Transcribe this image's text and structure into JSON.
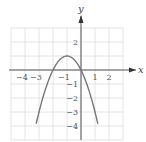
{
  "chart_data": {
    "type": "line",
    "title": "",
    "xlabel": "x",
    "ylabel": "y",
    "xlim": [
      -5,
      3
    ],
    "ylim": [
      -5,
      3
    ],
    "grid": true,
    "x_ticks": [
      "-4",
      "-3",
      "-1",
      "1",
      "2"
    ],
    "y_ticks": [
      "2",
      "-1",
      "-2",
      "-3",
      "-4"
    ],
    "series": [
      {
        "name": "parabola",
        "equation": "y = -x^2 - 2x",
        "x": [
          -3.2,
          -3,
          -2.5,
          -2,
          -1.5,
          -1,
          -0.5,
          0,
          0.5,
          1,
          1.2
        ],
        "y": [
          -3.84,
          -3,
          -1.25,
          0,
          0.75,
          1,
          0.75,
          0,
          -1.25,
          -3,
          -3.84
        ],
        "color": "#777777"
      }
    ],
    "vertex": [
      -1,
      1
    ],
    "x_intercepts": [
      -2,
      0
    ]
  },
  "colors": {
    "grid": "#dddddd",
    "axis": "#555555",
    "curve": "#777777"
  }
}
